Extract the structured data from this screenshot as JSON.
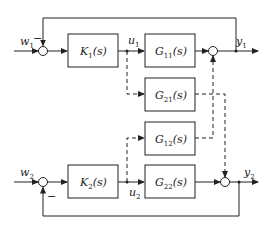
{
  "diagram": {
    "type": "MIMO decentralized control block diagram",
    "inputs": [
      {
        "name": "w",
        "sub": "1"
      },
      {
        "name": "w",
        "sub": "2"
      }
    ],
    "outputs": [
      {
        "name": "y",
        "sub": "1"
      },
      {
        "name": "y",
        "sub": "2"
      }
    ],
    "control_signals": [
      {
        "name": "u",
        "sub": "1"
      },
      {
        "name": "u",
        "sub": "2"
      }
    ],
    "blocks": {
      "K1": {
        "name": "K",
        "sub": "1",
        "arg": "(s)"
      },
      "K2": {
        "name": "K",
        "sub": "2",
        "arg": "(s)"
      },
      "G11": {
        "name": "G",
        "sub": "11",
        "arg": "(s)"
      },
      "G21": {
        "name": "G",
        "sub": "21",
        "arg": "(s)"
      },
      "G12": {
        "name": "G",
        "sub": "12",
        "arg": "(s)"
      },
      "G22": {
        "name": "G",
        "sub": "22",
        "arg": "(s)"
      }
    },
    "signs": {
      "feedback1": "−",
      "feedback2": "−"
    },
    "colors": {
      "line": "#222222",
      "background": "#ffffff"
    }
  }
}
